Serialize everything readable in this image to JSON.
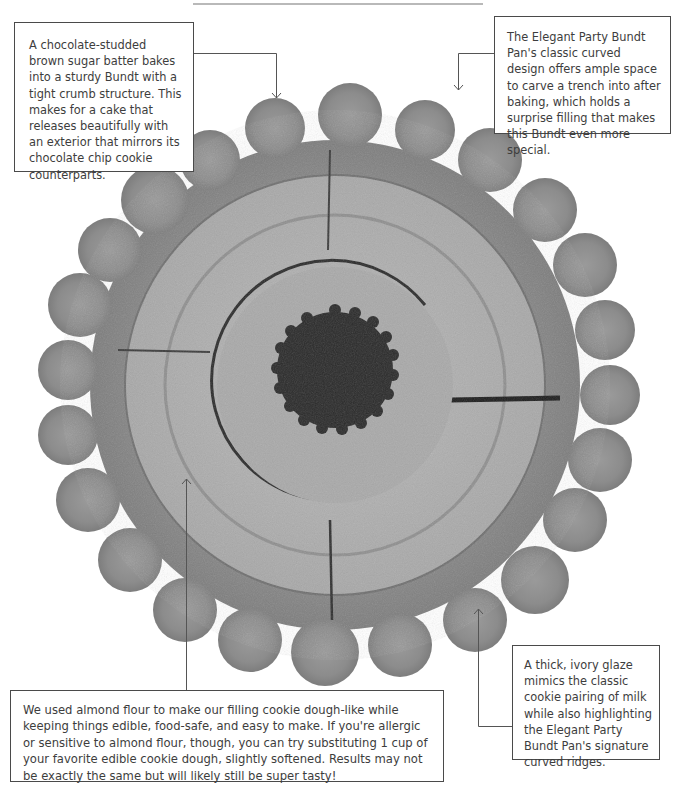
{
  "header": {
    "title_rule_color": "#b9b9b9"
  },
  "image": {
    "subject": "Chocolate chip cookie Bundt cake, top-down view",
    "icon": "bundt-cake-photo"
  },
  "callouts": {
    "top_left": {
      "text": "A chocolate-studded brown sugar batter bakes into a sturdy Bundt with a tight crumb structure. This makes for a cake that releases beautifully with an exterior that mirrors its chocolate chip cookie counterparts."
    },
    "top_right": {
      "text": "The Elegant Party Bundt Pan's classic curved design offers ample space to carve a trench into after baking, which holds a surprise filling that makes this Bundt even more special."
    },
    "bottom_left": {
      "text": "We used almond flour to make our filling cookie dough-like while keeping things edible, food-safe, and easy to make. If you're allergic or sensitive to almond flour, though, you can try substituting 1 cup of your favorite edible cookie dough, slightly softened. Results may not be exactly the same but will likely still be super tasty!"
    },
    "bottom_right": {
      "text": "A thick, ivory glaze mimics the classic cookie pairing of milk while also highlighting the Elegant Party Bundt Pan's signature curved ridges."
    }
  },
  "colors": {
    "border": "#4a4a4a",
    "text": "#3d3d3d",
    "connector": "#555555"
  }
}
